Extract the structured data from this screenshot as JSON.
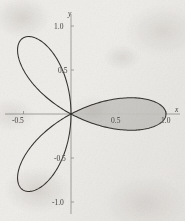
{
  "figure": {
    "background_color": "#efedea",
    "curve_color": "#2e2b27",
    "axis_color": "#8e8b86",
    "shade_color": "#c9c7c2",
    "text_color": "#3a3733"
  },
  "axes": {
    "x_name": "x",
    "y_name": "y"
  },
  "ticks": {
    "x": [
      {
        "label": "-0.5",
        "value": -0.5
      },
      {
        "label": "0.5",
        "value": 0.5
      },
      {
        "label": "1.0",
        "value": 1.0
      }
    ],
    "y": [
      {
        "label": "1.0",
        "value": 1.0
      },
      {
        "label": "0.5",
        "value": 0.5
      },
      {
        "label": "-0.5",
        "value": -0.5
      },
      {
        "label": "-1.0",
        "value": -1.0
      }
    ]
  },
  "chart_data": {
    "type": "line",
    "title": "",
    "xlabel": "x",
    "ylabel": "y",
    "xlim": [
      -0.82,
      1.2
    ],
    "ylim": [
      -1.18,
      1.18
    ],
    "grid": false,
    "legend": null,
    "coordinate_system": "polar",
    "equation": "r = cos(3θ)",
    "petal_count": 3,
    "petal_max_radius": 1.0,
    "petal_axis_angles_deg": [
      0,
      120,
      240
    ],
    "shaded_petal": {
      "index": 0,
      "angle_deg": 0,
      "theta_range_deg": [
        -30,
        30
      ],
      "fill": "#c9c7c2",
      "description": "right petal shaded gray"
    },
    "x_ticks": [
      -0.5,
      0.5,
      1.0
    ],
    "y_ticks": [
      -1.0,
      -0.5,
      0.5,
      1.0
    ],
    "x_tick_labels": [
      "-0.5",
      "0.5",
      "1.0"
    ],
    "y_tick_labels": [
      "-1.0",
      "-0.5",
      "0.5",
      "1.0"
    ],
    "series": [
      {
        "name": "r = cos(3θ)",
        "polar_points": [
          {
            "theta_deg": -30,
            "r": 0.0
          },
          {
            "theta_deg": -25,
            "r": 0.259
          },
          {
            "theta_deg": -20,
            "r": 0.5
          },
          {
            "theta_deg": -15,
            "r": 0.707
          },
          {
            "theta_deg": -10,
            "r": 0.866
          },
          {
            "theta_deg": -5,
            "r": 0.966
          },
          {
            "theta_deg": 0,
            "r": 1.0
          },
          {
            "theta_deg": 5,
            "r": 0.966
          },
          {
            "theta_deg": 10,
            "r": 0.866
          },
          {
            "theta_deg": 15,
            "r": 0.707
          },
          {
            "theta_deg": 20,
            "r": 0.5
          },
          {
            "theta_deg": 25,
            "r": 0.259
          },
          {
            "theta_deg": 30,
            "r": 0.0
          },
          {
            "theta_deg": 120,
            "r": 1.0
          },
          {
            "theta_deg": 240,
            "r": 1.0
          }
        ]
      }
    ]
  }
}
